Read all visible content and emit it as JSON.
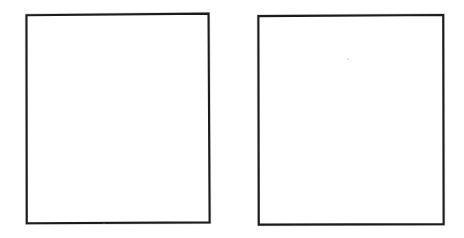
{
  "document": {
    "title": "Two blank rectangular frames",
    "description": "Scanned line drawing showing two empty rectangles side by side on a white page",
    "background_color": "#ffffff",
    "width": 464,
    "height": 238
  },
  "style": {
    "line_color": "#1c1c1c",
    "line_halo_color": "#8f8f8f",
    "line_width": 2.1,
    "fill_color": "#ffffff",
    "speck_color": "#d9d9d9"
  },
  "shapes": [
    {
      "id": "box-left",
      "name": "left-blank-frame",
      "label": "",
      "contents": "",
      "points": "26.5,15.2 208.5,13.6 209.6,222.4 26.8,223.2",
      "bounds": {
        "x": 26,
        "y": 13,
        "width": 184,
        "height": 211
      }
    },
    {
      "id": "box-right",
      "name": "right-blank-frame",
      "label": "",
      "contents": "",
      "points": "258.4,16.1 443.2,15.0 443.6,224.1 258.8,224.6",
      "bounds": {
        "x": 258,
        "y": 15,
        "width": 186,
        "height": 210
      }
    }
  ],
  "artifacts": {
    "specks": [
      {
        "cx": 348,
        "cy": 59,
        "r": 0.9
      },
      {
        "cx": 351,
        "cy": 61,
        "r": 0.6
      },
      {
        "cx": 104,
        "cy": 224,
        "r": 0.5
      },
      {
        "cx": 294,
        "cy": 226,
        "r": 0.5
      }
    ]
  }
}
